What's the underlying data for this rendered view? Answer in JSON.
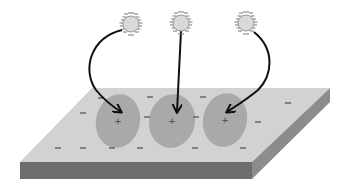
{
  "diagram": {
    "colors": {
      "background": "#ffffff",
      "slab_top": "#d2d2d2",
      "slab_front": "#6e6e6e",
      "slab_side": "#8c8c8c",
      "site_fill": "#a9a9a9",
      "ion_fill": "#d9d9d9",
      "ion_stroke": "#9a9a9a",
      "arrow": "#111111",
      "charge_mark": "#555555"
    },
    "ions": [
      {
        "id": "ion-1",
        "cx": 131,
        "cy": 24
      },
      {
        "id": "ion-2",
        "cx": 181,
        "cy": 23
      },
      {
        "id": "ion-3",
        "cx": 246,
        "cy": 23
      }
    ],
    "sites": [
      {
        "id": "site-1",
        "cx": 118,
        "cy": 121,
        "rx": 22,
        "ry": 27,
        "label": "+"
      },
      {
        "id": "site-2",
        "cx": 172,
        "cy": 121,
        "rx": 23,
        "ry": 27,
        "label": "+"
      },
      {
        "id": "site-3",
        "cx": 225,
        "cy": 120,
        "rx": 22,
        "ry": 27,
        "label": "+"
      }
    ],
    "surface_charges": {
      "label": "−",
      "positions": [
        [
          101,
          98
        ],
        [
          150,
          97
        ],
        [
          203,
          97
        ],
        [
          288,
          103
        ],
        [
          83,
          113
        ],
        [
          147,
          117
        ],
        [
          196,
          117
        ],
        [
          258,
          122
        ],
        [
          58,
          148
        ],
        [
          83,
          148
        ],
        [
          112,
          148
        ],
        [
          140,
          148
        ],
        [
          195,
          148
        ],
        [
          243,
          148
        ]
      ]
    }
  }
}
